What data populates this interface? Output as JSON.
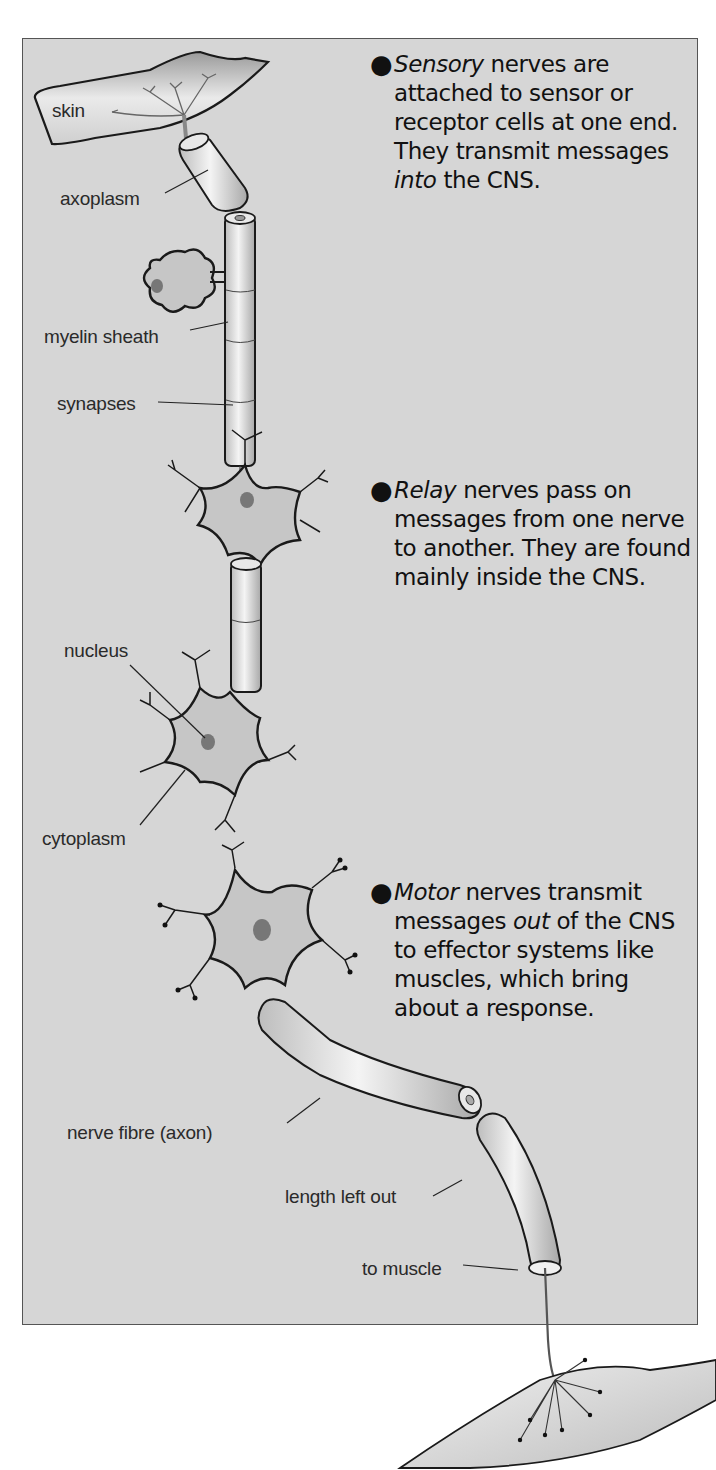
{
  "diagram": {
    "background_color": "#d6d6d6",
    "labels": {
      "skin": "skin",
      "axoplasm": "axoplasm",
      "myelin_sheath": "myelin sheath",
      "synapses": "synapses",
      "nucleus": "nucleus",
      "cytoplasm": "cytoplasm",
      "nerve_fibre": "nerve fibre (axon)",
      "length_left_out": "length left out",
      "to_muscle": "to muscle"
    },
    "notes": [
      {
        "id": "sensory",
        "emphasis": "Sensory",
        "text": " nerves are attached to sensor or receptor cells at one end. They transmit messages ",
        "emphasis2": "into",
        "text2": " the CNS."
      },
      {
        "id": "relay",
        "emphasis": "Relay",
        "text": " nerves pass on messages from one nerve to another. They are found mainly inside the CNS."
      },
      {
        "id": "motor",
        "emphasis": "Motor",
        "text": " nerves transmit messages ",
        "emphasis2": "out",
        "text2": " of the CNS to effector systems like muscles, which bring about a response."
      }
    ]
  }
}
